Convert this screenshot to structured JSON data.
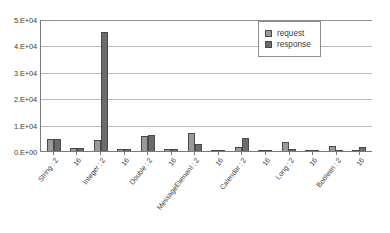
{
  "chart_data": {
    "type": "bar",
    "title": "",
    "subtitle": "",
    "xlabel": "",
    "ylabel": "",
    "ylim": [
      0,
      50000
    ],
    "grid": true,
    "legend_position": "top-right",
    "y_ticks": [
      {
        "value": 0,
        "label": "0.E+00"
      },
      {
        "value": 10000,
        "label": "1.E+04"
      },
      {
        "value": 20000,
        "label": "2.E+04"
      },
      {
        "value": 30000,
        "label": "3.E+04"
      },
      {
        "value": 40000,
        "label": "4.E+04"
      },
      {
        "value": 50000,
        "label": "5.E+04"
      }
    ],
    "categories": [
      "String : 2",
      "16",
      "Integer : 2",
      "16",
      "Double : 2",
      "16",
      "MessageElement : 2",
      "16",
      "Calendar : 2",
      "16",
      "Long : 2",
      "16",
      "Boolean : 2",
      "16"
    ],
    "series": [
      {
        "name": "request",
        "color": "#9a9a9a",
        "values": [
          4500,
          1000,
          4000,
          600,
          5500,
          700,
          7000,
          300,
          1500,
          400,
          3500,
          400,
          2000,
          300
        ]
      },
      {
        "name": "response",
        "color": "#6b6b6b",
        "values": [
          4500,
          1000,
          45000,
          600,
          6200,
          700,
          2500,
          300,
          5000,
          400,
          600,
          400,
          500,
          1500
        ]
      }
    ]
  },
  "legend": {
    "items": [
      {
        "label": "request"
      },
      {
        "label": "response"
      }
    ]
  }
}
